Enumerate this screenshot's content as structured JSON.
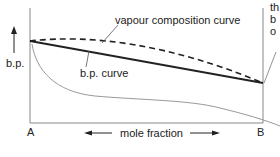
{
  "diagram": {
    "title": "",
    "y_axis_label": "b.p.",
    "x_axis_label": "mole fraction",
    "x_left_label": "A",
    "x_right_label": "B",
    "curve_labels": {
      "vapour": "vapour composition curve",
      "bp": "b.p. curve"
    },
    "cutoff_annotation_lines": [
      "th",
      "b",
      "o"
    ],
    "colors": {
      "line": "#222222",
      "frame": "#888888",
      "grey_curve": "#999999"
    }
  }
}
